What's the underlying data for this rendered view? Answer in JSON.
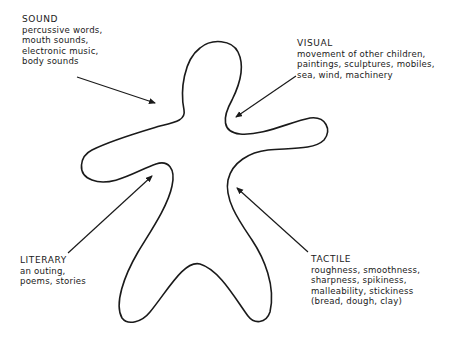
{
  "diagram": {
    "type": "annotated outline figure",
    "central_shape": "gingerbread-person outline",
    "categories": [
      {
        "key": "sound",
        "title": "SOUND",
        "lines": [
          "percussive words,",
          "mouth sounds,",
          "electronic music,",
          "body sounds"
        ]
      },
      {
        "key": "visual",
        "title": "VISUAL",
        "lines": [
          "movement of other children,",
          "paintings, sculptures, mobiles,",
          "sea, wind, machinery"
        ]
      },
      {
        "key": "literary",
        "title": "LITERARY",
        "lines": [
          "an outing,",
          "poems, stories"
        ]
      },
      {
        "key": "tactile",
        "title": "TACTILE",
        "lines": [
          "roughness, smoothness,",
          "sharpness, spikiness,",
          "malleability, stickiness",
          "(bread, dough, clay)"
        ]
      }
    ],
    "colors": {
      "line": "#1a1a1a",
      "background": "#ffffff"
    }
  }
}
